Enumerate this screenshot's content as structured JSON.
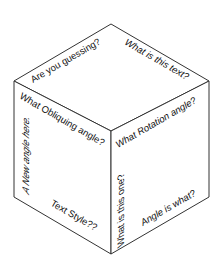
{
  "diagram": {
    "type": "isometric-cube",
    "colors": {
      "stroke": "#333333",
      "text": "#111111",
      "background": "#ffffff"
    },
    "faces": {
      "top": {
        "labels": [
          {
            "text": "Are you guessing?"
          },
          {
            "text": "What is this text?"
          }
        ]
      },
      "left": {
        "labels": [
          {
            "text": "What Obliquing angle?"
          },
          {
            "text": "A New angle here."
          },
          {
            "text": "Text Style??"
          }
        ]
      },
      "right": {
        "labels": [
          {
            "text": "What Rotation angle?"
          },
          {
            "text": "What is this one?"
          },
          {
            "text": "Angle is what?"
          }
        ]
      }
    }
  }
}
